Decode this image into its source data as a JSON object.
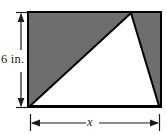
{
  "figure": {
    "kind": "geometry-diagram",
    "colors": {
      "shaded_region": "#6e6e6e",
      "unshaded_region": "#ffffff",
      "outline": "#000000",
      "dimension_line": "#1a1a1a",
      "background": "#ffffff"
    },
    "rectangle": {
      "name": "shaded-rectangle",
      "left": 27,
      "top": 11,
      "right": 162,
      "bottom": 108,
      "fill": "#6e6e6e",
      "stroke": "#000000",
      "stroke_width": 2
    },
    "triangle": {
      "name": "inscribed-white-triangle",
      "fill": "#ffffff",
      "stroke": "#000000",
      "stroke_width": 2,
      "vertices": [
        {
          "label": "bottom-left",
          "x": 30,
          "y": 106
        },
        {
          "label": "apex-top",
          "x": 131,
          "y": 13
        },
        {
          "label": "bottom-right",
          "x": 159,
          "y": 106
        }
      ]
    },
    "dimensions": [
      {
        "name": "height-dimension",
        "orientation": "vertical",
        "label": "6 in.",
        "value": "6",
        "unit": "in.",
        "line_x": 21,
        "from_y": 13,
        "to_y": 107,
        "arrowheads": "both",
        "tick_extent": 10
      },
      {
        "name": "width-dimension",
        "orientation": "horizontal",
        "label": "x",
        "value": "x",
        "unit": "",
        "line_y": 123,
        "from_x": 30,
        "to_x": 160,
        "arrowheads": "both",
        "tick_extent": 10
      }
    ]
  }
}
